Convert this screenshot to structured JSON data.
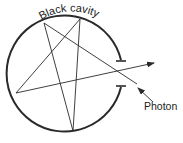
{
  "diagram": {
    "title_label": "Black cavity",
    "photon_label": "Photon",
    "colors": {
      "stroke": "#2a2a2a",
      "background": "#ffffff"
    },
    "elements": [
      {
        "type": "cavity-wall",
        "shape": "circle-with-aperture",
        "description": "Circular black cavity with a small opening on the right side"
      },
      {
        "type": "photon-path",
        "description": "Photon enters through the aperture and reflects multiple times inside the cavity, forming a star pattern"
      },
      {
        "type": "arrow",
        "description": "Outgoing ray exiting through the aperture"
      },
      {
        "type": "arrow",
        "description": "Incoming photon arrow pointing at the aperture"
      }
    ]
  }
}
